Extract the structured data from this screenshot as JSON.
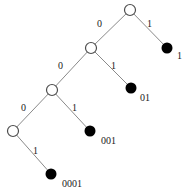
{
  "figure": {
    "type": "binary-tree-diagram",
    "title": "",
    "background_color": "#ffffff",
    "edge_color": "#8a8a8a",
    "internal_node_color": "#ffffff",
    "internal_node_stroke": "#4d4d4d",
    "leaf_node_color": "#000000"
  },
  "nodes": {
    "internal": [
      {
        "id": "root",
        "cx": 130,
        "cy": 10,
        "r": 5.5,
        "label": ""
      },
      {
        "id": "n0",
        "cx": 91,
        "cy": 48,
        "r": 5.5,
        "label": ""
      },
      {
        "id": "n00",
        "cx": 52,
        "cy": 90,
        "r": 5.5,
        "label": ""
      },
      {
        "id": "n000",
        "cx": 13,
        "cy": 131,
        "r": 5.5,
        "label": ""
      }
    ],
    "leaves": [
      {
        "id": "leaf-1",
        "cx": 167,
        "cy": 48,
        "r": 5.5,
        "label": "1",
        "label_x": 177,
        "label_y": 51
      },
      {
        "id": "leaf-01",
        "cx": 131,
        "cy": 88,
        "r": 5.5,
        "label": "01",
        "label_x": 140,
        "label_y": 93
      },
      {
        "id": "leaf-001",
        "cx": 90,
        "cy": 131,
        "r": 5.5,
        "label": "001",
        "label_x": 101,
        "label_y": 136
      },
      {
        "id": "leaf-0001",
        "cx": 51,
        "cy": 174,
        "r": 5.5,
        "label": "0001",
        "label_x": 62,
        "label_y": 179
      }
    ]
  },
  "edges": [
    {
      "id": "root-to-n0",
      "from": "root",
      "to": "n0",
      "bit": "0",
      "label_x": 97,
      "label_y": 19
    },
    {
      "id": "root-to-leaf1",
      "from": "root",
      "to": "leaf-1",
      "bit": "1",
      "label_x": 147,
      "label_y": 19
    },
    {
      "id": "n0-to-n00",
      "from": "n0",
      "to": "n00",
      "bit": "0",
      "label_x": 58,
      "label_y": 61
    },
    {
      "id": "n0-to-leaf01",
      "from": "n0",
      "to": "leaf-01",
      "bit": "1",
      "label_x": 111,
      "label_y": 61
    },
    {
      "id": "n00-to-n000",
      "from": "n00",
      "to": "n000",
      "bit": "0",
      "label_x": 21,
      "label_y": 103
    },
    {
      "id": "n00-to-leaf001",
      "from": "n00",
      "to": "leaf-001",
      "bit": "1",
      "label_x": 72,
      "label_y": 103
    },
    {
      "id": "n000-to-leaf0001",
      "from": "n000",
      "to": "leaf-0001",
      "bit": "1",
      "label_x": 33,
      "label_y": 146
    }
  ]
}
